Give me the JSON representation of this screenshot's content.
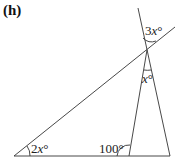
{
  "figure": {
    "label": "(h)",
    "angles": {
      "bottom_left": {
        "coef": "2",
        "var": "x",
        "unit": "°"
      },
      "top_exterior": {
        "coef": "3",
        "var": "x",
        "unit": "°"
      },
      "apex_interior": {
        "coef": "",
        "var": "x",
        "unit": "°"
      },
      "base_angle": {
        "value": "100°"
      }
    }
  }
}
